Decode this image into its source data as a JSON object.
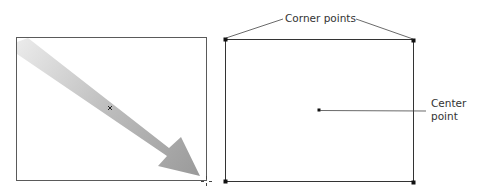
{
  "labels": {
    "corner_points": "Corner points",
    "center_point_line1": "Center",
    "center_point_line2": "point"
  },
  "colors": {
    "frame": "#555555",
    "point": "#111111",
    "leader": "#444444",
    "arrow_start": "#e6e6e6",
    "arrow_end": "#999999",
    "text": "#333333"
  },
  "left_panel": {
    "description": "Shape being drawn by dragging from corner",
    "frame": {
      "x": 16,
      "y": 37,
      "width": 190,
      "height": 143
    },
    "center_marker": {
      "x": 110,
      "y": 108,
      "glyph": "x"
    },
    "cursor": {
      "x": 206,
      "y": 181,
      "type": "crosshair"
    }
  },
  "right_panel": {
    "frame": {
      "x": 225,
      "y": 39,
      "width": 188,
      "height": 143
    },
    "corner_points": [
      {
        "x": 225,
        "y": 39
      },
      {
        "x": 413,
        "y": 40
      },
      {
        "x": 225,
        "y": 181
      },
      {
        "x": 413,
        "y": 182
      }
    ],
    "center_point": {
      "x": 319,
      "y": 110
    }
  }
}
